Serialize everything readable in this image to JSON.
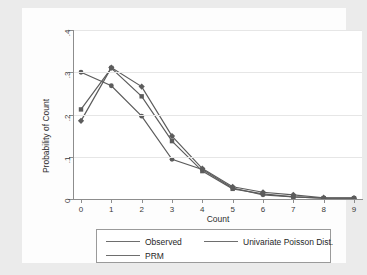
{
  "chart_data": {
    "type": "line",
    "title": "",
    "xlabel": "Count",
    "ylabel": "Probability of Count",
    "x": [
      0,
      1,
      2,
      3,
      4,
      5,
      6,
      7,
      8,
      9
    ],
    "xticklabels": [
      "0",
      "1",
      "2",
      "3",
      "4",
      "5",
      "6",
      "7",
      "8",
      "9"
    ],
    "yticklabels": [
      "0",
      ".1",
      ".2",
      ".3",
      ".4"
    ],
    "ytickvalues": [
      0,
      0.1,
      0.2,
      0.3,
      0.4
    ],
    "xlim": [
      0,
      9
    ],
    "ylim": [
      0,
      0.4
    ],
    "grid": "horizontal",
    "legend_position": "bottom",
    "series": [
      {
        "name": "Observed",
        "marker": "circle",
        "color": "#5c5c5c",
        "values": [
          0.3,
          0.268,
          0.196,
          0.094,
          0.07,
          0.026,
          0.01,
          0.005,
          0.002,
          0.002
        ]
      },
      {
        "name": "PRM",
        "marker": "square",
        "color": "#5c5c5c",
        "values": [
          0.212,
          0.31,
          0.243,
          0.137,
          0.066,
          0.024,
          0.012,
          0.005,
          0.002,
          0.002
        ]
      },
      {
        "name": "Univariate Poisson Dist.",
        "marker": "diamond",
        "color": "#5c5c5c",
        "values": [
          0.185,
          0.311,
          0.266,
          0.149,
          0.072,
          0.029,
          0.016,
          0.01,
          0.003,
          0.002
        ]
      }
    ]
  },
  "legend": {
    "entries": [
      {
        "label": "Observed",
        "marker": "circle"
      },
      {
        "label": "Univariate Poisson Dist.",
        "marker": "diamond"
      },
      {
        "label": "PRM",
        "marker": "square"
      }
    ]
  },
  "colors": {
    "figure_background": "#ebebeb",
    "panel_background": "#ffffff",
    "axis": "#8d8d8d",
    "gridline": "#e6e6e6",
    "series": "#5c5c5c",
    "text": "#1f1f1f"
  }
}
